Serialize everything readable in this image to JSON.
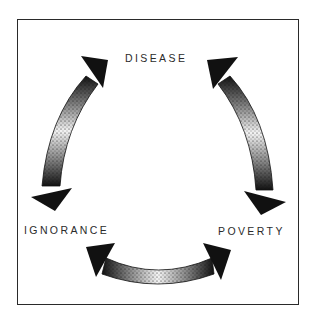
{
  "diagram": {
    "type": "cycle",
    "nodes": [
      {
        "id": "disease",
        "label": "DISEASE"
      },
      {
        "id": "ignorance",
        "label": "IGNORANCE"
      },
      {
        "id": "poverty",
        "label": "POVERTY"
      }
    ],
    "edges": [
      {
        "from": "ignorance",
        "to": "disease",
        "bidirectional": true
      },
      {
        "from": "disease",
        "to": "poverty",
        "bidirectional": true
      },
      {
        "from": "ignorance",
        "to": "poverty",
        "bidirectional": true
      }
    ],
    "colors": {
      "border": "#2a2a2a",
      "arrow_dark": "#111111",
      "arrow_light": "#ffffff",
      "text": "#2b2b2b"
    }
  }
}
